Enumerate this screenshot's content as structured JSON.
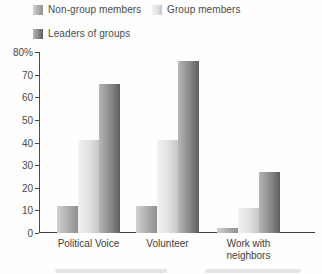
{
  "legend": {
    "items": [
      {
        "label": "Non-group members"
      },
      {
        "label": "Group members"
      },
      {
        "label": "Leaders of groups"
      }
    ]
  },
  "chart_data": {
    "type": "bar",
    "title": "",
    "categories": [
      "Political Voice",
      "Volunteer",
      "Work with neighbors"
    ],
    "series": [
      {
        "name": "Non-group members",
        "values": [
          12,
          12,
          2
        ],
        "gradient": [
          "#d2d2d2",
          "#acacac",
          "#8f8f8f"
        ]
      },
      {
        "name": "Group members",
        "values": [
          41,
          41,
          11
        ],
        "gradient": [
          "#f3f3f3",
          "#e0e0e0",
          "#c6c6c6"
        ]
      },
      {
        "name": "Leaders of groups",
        "values": [
          66,
          76,
          27
        ],
        "gradient": [
          "#b6b6b6",
          "#8a8a8a",
          "#5e5e5e"
        ]
      }
    ],
    "xlabel": "",
    "ylabel": "",
    "ylim": [
      0,
      80
    ],
    "yticks": [
      0,
      10,
      20,
      30,
      40,
      50,
      60,
      70,
      80
    ],
    "ytick_labels": [
      "0",
      "10",
      "20",
      "30",
      "40",
      "50",
      "60",
      "70",
      "80%"
    ],
    "grid": false,
    "legend_position": "top-left",
    "axis_color": "#4a4a4a"
  }
}
